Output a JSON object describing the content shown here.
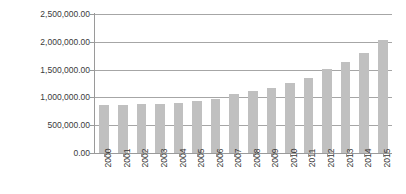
{
  "chart_data": {
    "type": "bar",
    "title": "",
    "subtitle": "",
    "xlabel": "",
    "ylabel": "",
    "categories": [
      "2000",
      "2001",
      "2002",
      "2003",
      "2004",
      "2005",
      "2006",
      "2007",
      "2008",
      "2009",
      "2010",
      "2011",
      "2012",
      "2013",
      "2014",
      "2015"
    ],
    "values": [
      860000,
      870000,
      880000,
      890000,
      900000,
      930000,
      980000,
      1060000,
      1120000,
      1170000,
      1260000,
      1350000,
      1520000,
      1640000,
      1790000,
      2040000
    ],
    "series": [
      {
        "name": "Series 1",
        "values": [
          860000,
          870000,
          880000,
          890000,
          900000,
          930000,
          980000,
          1060000,
          1120000,
          1170000,
          1260000,
          1350000,
          1520000,
          1640000,
          1790000,
          2040000
        ],
        "color": "#c0c0c0"
      }
    ],
    "ylim": [
      0,
      2500000
    ],
    "ytick_values": [
      0,
      500000,
      1000000,
      1500000,
      2000000,
      2500000
    ],
    "ytick_labels": [
      "0.00",
      "500,000.00",
      "1,000,000.00",
      "1,500,000.00",
      "2,000,000.00",
      "2,500,000.00"
    ],
    "grid": "horizontal",
    "legend": "none",
    "annotations": [],
    "xlabel_rotation": 90,
    "colors": {
      "bar": "#c0c0c0",
      "gridline": "#a6a6a6",
      "axis": "#9a9a9a",
      "text": "#3a3a3a",
      "background": "#ffffff"
    }
  }
}
